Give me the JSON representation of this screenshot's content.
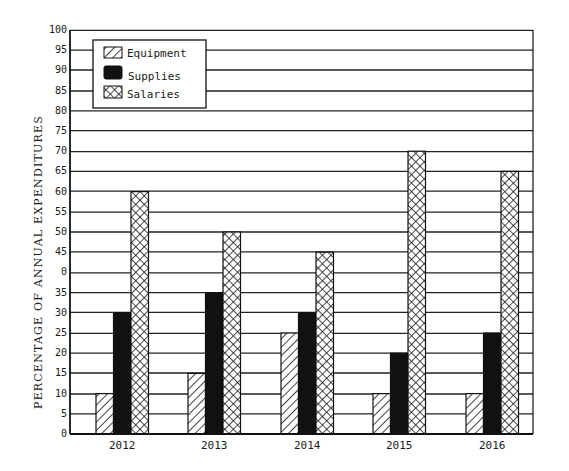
{
  "chart_data": {
    "type": "bar",
    "title": "",
    "xlabel": "",
    "ylabel": "PERCENTAGE OF ANNUAL EXPENDITURES",
    "ylim": [
      0,
      100
    ],
    "yticks": [
      0,
      5,
      10,
      15,
      20,
      25,
      30,
      35,
      40,
      45,
      50,
      55,
      60,
      65,
      70,
      75,
      80,
      85,
      90,
      95,
      100
    ],
    "ytick_labels": [
      "0",
      "5",
      "10",
      "15",
      "20",
      "25",
      "30",
      "35",
      "0",
      "45",
      "50",
      "55",
      "60",
      "65",
      "70",
      "75",
      "80",
      "85",
      "90",
      "95",
      "100"
    ],
    "grid": true,
    "legend_position": "upper-left",
    "categories": [
      "2012",
      "2013",
      "2014",
      "2015",
      "2016"
    ],
    "series": [
      {
        "name": "Equipment",
        "pattern": "diagonal-hatch",
        "values": [
          10,
          15,
          25,
          10,
          10
        ]
      },
      {
        "name": "Supplies",
        "pattern": "solid-black",
        "values": [
          30,
          35,
          30,
          20,
          25
        ]
      },
      {
        "name": "Salaries",
        "pattern": "crosshatch",
        "values": [
          60,
          50,
          45,
          70,
          65
        ]
      }
    ]
  },
  "colors": {
    "ink": "#111111",
    "background": "#ffffff"
  }
}
